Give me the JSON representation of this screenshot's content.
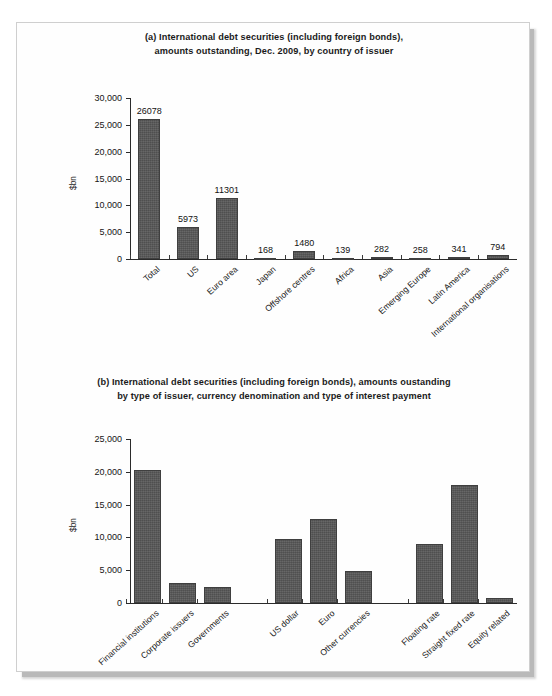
{
  "page": {
    "background_color": "#ffffff",
    "sheet_color": "#fefefe",
    "bar_color": "#575757",
    "axis_color": "#2b2b2b",
    "text_color": "#161616"
  },
  "chart_data": [
    {
      "type": "bar",
      "panel": "(a)",
      "title_line1": "(a) International debt securities (including foreign bonds),",
      "title_line2": "amounts outstanding, Dec. 2009, by country of issuer",
      "ylabel": "$bn",
      "xlabel": "",
      "ylim": [
        0,
        30000
      ],
      "yticks": [
        0,
        5000,
        10000,
        15000,
        20000,
        25000,
        30000
      ],
      "ytick_labels": [
        "0",
        "5,000",
        "10,000",
        "15,000",
        "20,000",
        "25,000",
        "30,000"
      ],
      "grid": false,
      "legend": "none",
      "categories": [
        "Total",
        "US",
        "Euro area",
        "Japan",
        "Offshore centres",
        "Africa",
        "Asia",
        "Emerging Europe",
        "Latin America",
        "International organisations"
      ],
      "values": [
        26078,
        5973,
        11301,
        168,
        1480,
        139,
        282,
        258,
        341,
        794
      ],
      "data_labels": [
        "26078",
        "5973",
        "11301",
        "168",
        "1480",
        "139",
        "282",
        "258",
        "341",
        "794"
      ]
    },
    {
      "type": "bar",
      "panel": "(b)",
      "title_line1": "(b) International debt securities (including foreign bonds), amounts oustanding",
      "title_line2": "by type of issuer, currency denomination and type of interest payment",
      "ylabel": "$bn",
      "xlabel": "",
      "ylim": [
        0,
        25000
      ],
      "yticks": [
        0,
        5000,
        10000,
        15000,
        20000,
        25000
      ],
      "ytick_labels": [
        "0",
        "5,000",
        "10,000",
        "15,000",
        "20,000",
        "25,000"
      ],
      "grid": false,
      "legend": "none",
      "groups": [
        "type of issuer",
        "currency denomination",
        "type of interest payment"
      ],
      "categories": [
        "Financial institutions",
        "Corporate issuers",
        "Governments",
        "US dollar",
        "Euro",
        "Other currencies",
        "Floating rate",
        "Straight fixed rate",
        "Equity related"
      ],
      "values": [
        20200,
        3100,
        2400,
        9800,
        12800,
        4900,
        9000,
        18000,
        700
      ],
      "data_labels": [
        "",
        "",
        "",
        "",
        "",
        "",
        "",
        "",
        ""
      ]
    }
  ]
}
